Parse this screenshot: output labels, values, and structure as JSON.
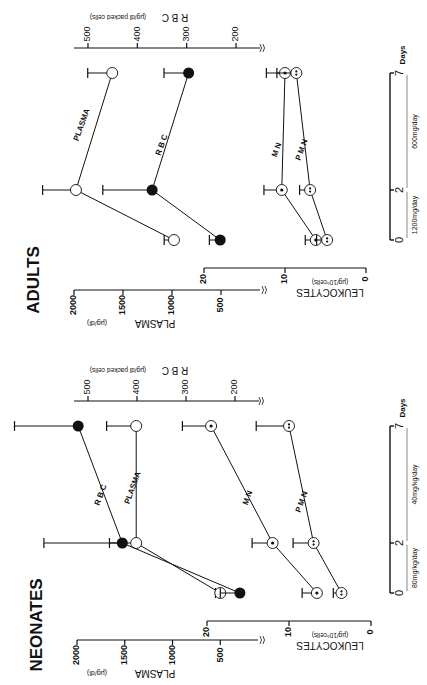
{
  "figure": {
    "orientation": "rotated-90-ccw",
    "colors": {
      "ink": "#111111",
      "background": "#ffffff"
    }
  },
  "chart_data": [
    {
      "type": "line",
      "title": "ADULTS",
      "x": [
        0,
        2,
        7
      ],
      "xlabel": "Days",
      "x_ticks": [
        "0",
        "2",
        "7"
      ],
      "dosing": [
        {
          "label": "1200mg/day",
          "from": 0,
          "to": 2
        },
        {
          "label": "600mg/day",
          "from": 2,
          "to": 7
        }
      ],
      "axes": {
        "plasma": {
          "label": "PLASMA",
          "unit": "(µg/dl)",
          "ticks": [
            "2000",
            "1500",
            "1000",
            "500"
          ],
          "range": [
            0,
            2000
          ]
        },
        "rbc": {
          "label": "R B C",
          "unit": "(µg/dl packed cells)",
          "ticks": [
            "500",
            "400",
            "300",
            "200"
          ],
          "range": [
            150,
            550
          ]
        },
        "leukocytes": {
          "label": "LEUKOCYTES",
          "unit": "(µg/10⁹cells)",
          "ticks": [
            "20",
            "10",
            "0"
          ],
          "range": [
            0,
            20
          ]
        }
      },
      "series": [
        {
          "name": "PLASMA",
          "axis": "plasma",
          "marker": "open-circle",
          "values": [
            980,
            1980,
            1610
          ],
          "error": [
            100,
            340,
            250
          ]
        },
        {
          "name": "R B C",
          "axis": "rbc",
          "marker": "filled-circle",
          "values": [
            232,
            370,
            296
          ],
          "error": [
            22,
            100,
            50
          ]
        },
        {
          "name": "M N",
          "axis": "leukocytes",
          "marker": "circle-dot",
          "values": [
            6.2,
            10.4,
            10.0
          ],
          "error": [
            1.3,
            2.2,
            2.3
          ]
        },
        {
          "name": "P M N",
          "axis": "leukocytes",
          "marker": "circle-double-dot",
          "values": [
            4.8,
            6.9,
            8.6
          ],
          "error": [
            1.3,
            1.3,
            2.4
          ]
        }
      ]
    },
    {
      "type": "line",
      "title": "NEONATES",
      "x": [
        0,
        2,
        7
      ],
      "xlabel": "Days",
      "x_ticks": [
        "0",
        "2",
        "7"
      ],
      "dosing": [
        {
          "label": "80mg/kg/day",
          "from": 0,
          "to": 2
        },
        {
          "label": "40mg/kg/day",
          "from": 2,
          "to": 7
        }
      ],
      "axes": {
        "plasma": {
          "label": "PLASMA",
          "unit": "(µg/dl)",
          "ticks": [
            "2000",
            "1500",
            "1000",
            "500"
          ],
          "range": [
            0,
            2000
          ]
        },
        "rbc": {
          "label": "R B C",
          "unit": "(µg/dl packed cells)",
          "ticks": [
            "500",
            "400",
            "300",
            "200"
          ],
          "range": [
            150,
            550
          ]
        },
        "leukocytes": {
          "label": "LEUKOCYTES",
          "unit": "(µg/10⁹cells)",
          "ticks": [
            "20",
            "10",
            "0"
          ],
          "range": [
            0,
            20
          ]
        }
      },
      "series": [
        {
          "name": "PLASMA",
          "axis": "plasma",
          "marker": "open-circle",
          "values": [
            500,
            1380,
            1380
          ],
          "error": [
            50,
            280,
            310
          ]
        },
        {
          "name": "R B C",
          "axis": "rbc",
          "marker": "filled-circle",
          "values": [
            190,
            430,
            520
          ],
          "error": [
            40,
            160,
            130
          ]
        },
        {
          "name": "M N",
          "axis": "leukocytes",
          "marker": "circle-dot",
          "values": [
            6.6,
            12,
            19.5
          ],
          "error": [
            1.8,
            2.5,
            3.5
          ]
        },
        {
          "name": "P M N",
          "axis": "leukocytes",
          "marker": "circle-double-dot",
          "values": [
            3.6,
            7,
            10
          ],
          "error": [
            1.0,
            2.5,
            4.0
          ]
        }
      ]
    }
  ]
}
